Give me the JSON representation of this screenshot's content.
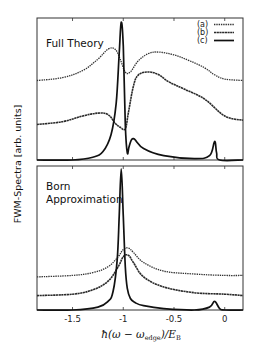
{
  "chart_data": {
    "type": "line",
    "title": "",
    "xlabel": "ħ(ω − ω_edge)/E_B",
    "xlabel_parts": {
      "prefix": "ħ(ω − ω",
      "sub": "edge",
      "suffix": ")/E",
      "sub2": "B"
    },
    "ylabel": "FWM-Spectra [arb. units]",
    "xlim": [
      -1.85,
      0.18
    ],
    "xticks": [
      -1.5,
      -1,
      -0.5,
      0
    ],
    "xtick_labels": [
      "-1.5",
      "-1",
      "-0.5",
      "0"
    ],
    "grid": false,
    "legend": {
      "position": "top-right (upper panel)",
      "entries": [
        {
          "label": "(a)",
          "style": "dotted"
        },
        {
          "label": "(b)",
          "style": "dashed"
        },
        {
          "label": "(c)",
          "style": "solid"
        }
      ]
    },
    "panels": [
      {
        "name": "Full Theory",
        "ylim": [
          0,
          1
        ],
        "series": [
          {
            "name": "(a)",
            "x": [
              -1.85,
              -1.6,
              -1.4,
              -1.25,
              -1.15,
              -1.08,
              -1.03,
              -0.98,
              -0.93,
              -0.85,
              -0.75,
              -0.65,
              -0.5,
              -0.35,
              -0.2,
              -0.1,
              0.0,
              0.18
            ],
            "y": [
              0.56,
              0.58,
              0.63,
              0.71,
              0.78,
              0.78,
              0.71,
              0.62,
              0.62,
              0.7,
              0.75,
              0.76,
              0.74,
              0.7,
              0.65,
              0.6,
              0.57,
              0.56
            ]
          },
          {
            "name": "(b)",
            "x": [
              -1.85,
              -1.6,
              -1.4,
              -1.25,
              -1.15,
              -1.08,
              -1.03,
              -0.98,
              -0.95,
              -0.9,
              -0.85,
              -0.75,
              -0.65,
              -0.55,
              -0.4,
              -0.2,
              0.0,
              0.18
            ],
            "y": [
              0.25,
              0.27,
              0.31,
              0.33,
              0.32,
              0.26,
              0.23,
              0.22,
              0.33,
              0.52,
              0.6,
              0.62,
              0.6,
              0.55,
              0.5,
              0.43,
              0.31,
              0.28
            ]
          },
          {
            "name": "(c)",
            "x": [
              -1.85,
              -1.5,
              -1.3,
              -1.2,
              -1.12,
              -1.07,
              -1.04,
              -1.02,
              -1.0,
              -0.98,
              -0.96,
              -0.94,
              -0.9,
              -0.8,
              -0.6,
              -0.3,
              -0.15,
              -0.1,
              -0.08,
              -0.05,
              0.18
            ],
            "y": [
              0.0,
              0.0,
              0.02,
              0.06,
              0.18,
              0.4,
              0.75,
              0.97,
              0.8,
              0.25,
              0.05,
              0.1,
              0.15,
              0.08,
              0.03,
              0.01,
              0.03,
              0.13,
              0.05,
              0.0,
              0.0
            ]
          }
        ]
      },
      {
        "name": "Born Approximation",
        "ylim": [
          0,
          1
        ],
        "series": [
          {
            "name": "(a)",
            "x": [
              -1.85,
              -1.5,
              -1.3,
              -1.15,
              -1.05,
              -1.0,
              -0.95,
              -0.9,
              -0.8,
              -0.6,
              -0.3,
              0.0,
              0.18
            ],
            "y": [
              0.23,
              0.24,
              0.26,
              0.3,
              0.37,
              0.42,
              0.43,
              0.4,
              0.33,
              0.27,
              0.25,
              0.24,
              0.24
            ]
          },
          {
            "name": "(b)",
            "x": [
              -1.85,
              -1.5,
              -1.3,
              -1.15,
              -1.05,
              -1.0,
              -0.95,
              -0.9,
              -0.8,
              -0.6,
              -0.3,
              0.0,
              0.18
            ],
            "y": [
              0.1,
              0.11,
              0.14,
              0.2,
              0.3,
              0.37,
              0.38,
              0.33,
              0.23,
              0.16,
              0.12,
              0.11,
              0.1
            ]
          },
          {
            "name": "(c)",
            "x": [
              -1.85,
              -1.5,
              -1.25,
              -1.15,
              -1.1,
              -1.06,
              -1.04,
              -1.02,
              -1.0,
              -0.98,
              -0.96,
              -0.93,
              -0.88,
              -0.8,
              -0.6,
              -0.3,
              -0.15,
              -0.1,
              -0.05,
              0.0,
              0.18
            ],
            "y": [
              0.0,
              0.0,
              0.02,
              0.06,
              0.13,
              0.35,
              0.65,
              0.98,
              0.65,
              0.3,
              0.15,
              0.08,
              0.05,
              0.03,
              0.01,
              0.0,
              0.02,
              0.06,
              0.01,
              0.0,
              0.0
            ]
          }
        ]
      }
    ]
  }
}
